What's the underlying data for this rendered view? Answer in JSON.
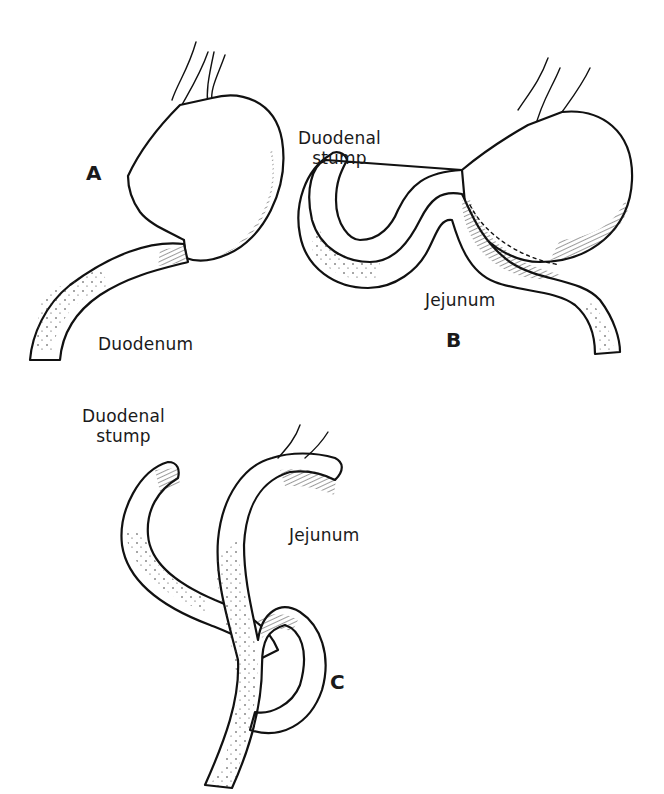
{
  "figure": {
    "panels": [
      {
        "id": "A",
        "letter": "A",
        "labels": {
          "bottom": "Duodenum"
        }
      },
      {
        "id": "B",
        "letter": "B",
        "labels": {
          "stump": "Duodenal stump",
          "stump_line1": "Duodenal",
          "stump_line2": "stump",
          "loop": "Jejunum"
        }
      },
      {
        "id": "C",
        "letter": "C",
        "labels": {
          "stump": "Duodenal stump",
          "stump_line1": "Duodenal",
          "stump_line2": "stump",
          "loop": "Jejunum"
        }
      }
    ],
    "colors": {
      "ink": "#111111",
      "background": "#ffffff"
    }
  }
}
